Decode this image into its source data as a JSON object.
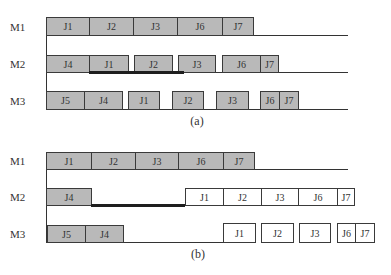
{
  "diagram": {
    "type": "gantt-schedule",
    "panels": [
      {
        "id": "a",
        "caption": "(a)",
        "caption_pos": {
          "x": 197,
          "y": 114
        },
        "axis": {
          "x": 46,
          "y0": 17,
          "y1": 110
        },
        "rows": [
          {
            "machine": "M1",
            "top": 17,
            "height": 19,
            "label_y": 21,
            "baseline_end": 348,
            "blocks": [
              {
                "label": "J1",
                "x0": 46,
                "x1": 89,
                "fill": "gray"
              },
              {
                "label": "J2",
                "x0": 89,
                "x1": 133,
                "fill": "gray"
              },
              {
                "label": "J3",
                "x0": 133,
                "x1": 177,
                "fill": "gray"
              },
              {
                "label": "J6",
                "x0": 177,
                "x1": 222,
                "fill": "gray"
              },
              {
                "label": "J7",
                "x0": 222,
                "x1": 253,
                "fill": "gray"
              }
            ]
          },
          {
            "machine": "M2",
            "top": 55,
            "height": 18,
            "label_y": 58,
            "baseline_end": 348,
            "delay": {
              "x0": 89,
              "x1": 184
            },
            "blocks": [
              {
                "label": "J4",
                "x0": 46,
                "x1": 89,
                "fill": "gray"
              },
              {
                "label": "J1",
                "x0": 89,
                "x1": 128,
                "fill": "gray"
              },
              {
                "label": "J2",
                "x0": 134,
                "x1": 172,
                "fill": "gray"
              },
              {
                "label": "J3",
                "x0": 178,
                "x1": 215,
                "fill": "gray"
              },
              {
                "label": "J6",
                "x0": 222,
                "x1": 260,
                "fill": "gray"
              },
              {
                "label": "J7",
                "x0": 260,
                "x1": 278,
                "fill": "gray"
              }
            ]
          },
          {
            "machine": "M3",
            "top": 91,
            "height": 19,
            "label_y": 95,
            "baseline_end": 348,
            "blocks": [
              {
                "label": "J5",
                "x0": 46,
                "x1": 84,
                "fill": "gray"
              },
              {
                "label": "J4",
                "x0": 84,
                "x1": 122,
                "fill": "gray"
              },
              {
                "label": "J1",
                "x0": 128,
                "x1": 159,
                "fill": "gray"
              },
              {
                "label": "J2",
                "x0": 172,
                "x1": 203,
                "fill": "gray"
              },
              {
                "label": "J3",
                "x0": 216,
                "x1": 248,
                "fill": "gray"
              },
              {
                "label": "J6",
                "x0": 260,
                "x1": 279,
                "fill": "gray"
              },
              {
                "label": "J7",
                "x0": 279,
                "x1": 298,
                "fill": "gray"
              }
            ]
          }
        ]
      },
      {
        "id": "b",
        "caption": "(b)",
        "caption_pos": {
          "x": 198,
          "y": 247
        },
        "axis": {
          "x": 46,
          "y0": 152,
          "y1": 243
        },
        "rows": [
          {
            "machine": "M1",
            "top": 152,
            "height": 18,
            "label_y": 155,
            "baseline_end": 348,
            "blocks": [
              {
                "label": "J1",
                "x0": 46,
                "x1": 91,
                "fill": "gray"
              },
              {
                "label": "J2",
                "x0": 91,
                "x1": 135,
                "fill": "gray"
              },
              {
                "label": "J3",
                "x0": 135,
                "x1": 178,
                "fill": "gray"
              },
              {
                "label": "J6",
                "x0": 178,
                "x1": 223,
                "fill": "gray"
              },
              {
                "label": "J7",
                "x0": 223,
                "x1": 254,
                "fill": "gray"
              }
            ]
          },
          {
            "machine": "M2",
            "top": 188,
            "height": 18,
            "label_y": 191,
            "baseline_end": 185,
            "delay": {
              "x0": 91,
              "x1": 185
            },
            "blocks": [
              {
                "label": "J4",
                "x0": 46,
                "x1": 91,
                "fill": "gray"
              },
              {
                "label": "J1",
                "x0": 185,
                "x1": 223,
                "fill": "white"
              },
              {
                "label": "J2",
                "x0": 223,
                "x1": 261,
                "fill": "white"
              },
              {
                "label": "J3",
                "x0": 261,
                "x1": 298,
                "fill": "white"
              },
              {
                "label": "J6",
                "x0": 298,
                "x1": 337,
                "fill": "white"
              },
              {
                "label": "J7",
                "x0": 337,
                "x1": 354,
                "fill": "white"
              }
            ]
          },
          {
            "machine": "M3",
            "top": 225,
            "height": 18,
            "label_y": 228,
            "baseline_end": 223,
            "blocks": [
              {
                "label": "J5",
                "x0": 47,
                "x1": 85,
                "fill": "gray"
              },
              {
                "label": "J4",
                "x0": 85,
                "x1": 123,
                "fill": "gray"
              },
              {
                "label": "J1",
                "x0": 223,
                "x1": 255,
                "fill": "white"
              },
              {
                "label": "J2",
                "x0": 261,
                "x1": 293,
                "fill": "white"
              },
              {
                "label": "J3",
                "x0": 299,
                "x1": 330,
                "fill": "white"
              },
              {
                "label": "J6",
                "x0": 337,
                "x1": 355,
                "fill": "white"
              },
              {
                "label": "J7",
                "x0": 355,
                "x1": 374,
                "fill": "white"
              }
            ]
          }
        ]
      }
    ],
    "colors": {
      "gray_block": "#b9b9b9",
      "white_block": "#ffffff",
      "delay_bar": "#1e1e1e",
      "lines": "#333333"
    }
  }
}
